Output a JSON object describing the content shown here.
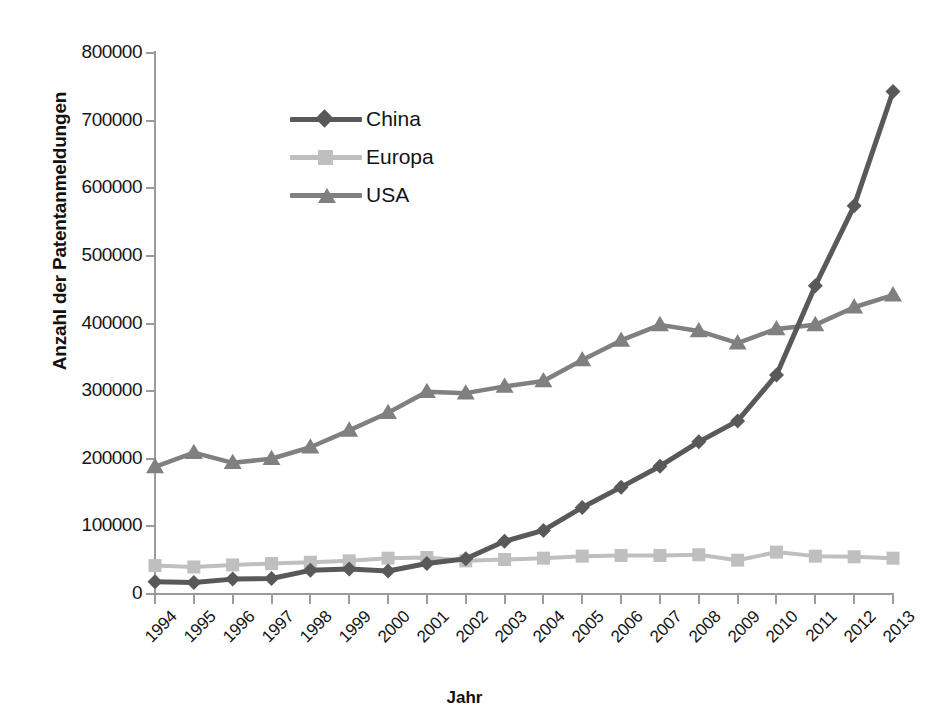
{
  "chart_data": {
    "type": "line",
    "title": "",
    "xlabel": "Jahr",
    "ylabel": "Anzahl der Patentanmeldungen",
    "categories": [
      "1994",
      "1995",
      "1996",
      "1997",
      "1998",
      "1999",
      "2000",
      "2001",
      "2002",
      "2003",
      "2004",
      "2005",
      "2006",
      "2007",
      "2008",
      "2009",
      "2010",
      "2011",
      "2012",
      "2013"
    ],
    "ylim": [
      0,
      800000
    ],
    "ytick_labels": [
      "800000",
      "700000",
      "600000",
      "500000",
      "400000",
      "300000",
      "200000",
      "100000",
      "0"
    ],
    "ytick_values": [
      800000,
      700000,
      600000,
      500000,
      400000,
      300000,
      200000,
      100000,
      0
    ],
    "grid": false,
    "legend_position": "upper-left-inside",
    "series": [
      {
        "name": "China",
        "color": "#595959",
        "marker": "diamond",
        "values": [
          18000,
          17000,
          22000,
          23000,
          35000,
          37000,
          34000,
          45000,
          52000,
          78000,
          94000,
          128000,
          158000,
          189000,
          225000,
          256000,
          324000,
          456000,
          574000,
          743000
        ]
      },
      {
        "name": "Europa",
        "color": "#bfbfbf",
        "marker": "square",
        "values": [
          42000,
          40000,
          43000,
          45000,
          47000,
          49000,
          53000,
          54000,
          49000,
          51000,
          53000,
          56000,
          57000,
          57000,
          58000,
          50000,
          62000,
          56000,
          55000,
          53000
        ]
      },
      {
        "name": "USA",
        "color": "#808080",
        "marker": "triangle",
        "values": [
          188000,
          209000,
          194000,
          200000,
          217000,
          242000,
          268000,
          299000,
          297000,
          307000,
          315000,
          346000,
          375000,
          398000,
          389000,
          371000,
          392000,
          398000,
          424000,
          442000
        ]
      }
    ]
  },
  "legend": {
    "items": [
      {
        "label": "China"
      },
      {
        "label": "Europa"
      },
      {
        "label": "USA"
      }
    ]
  }
}
